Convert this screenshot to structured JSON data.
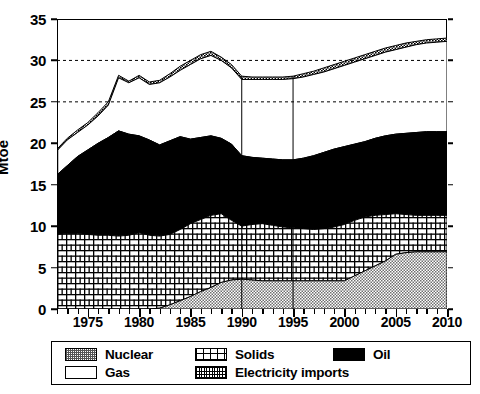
{
  "chart_data": {
    "type": "area",
    "stacked": true,
    "title": "",
    "xlabel": "",
    "ylabel": "Mtoe",
    "ylim": [
      0,
      35
    ],
    "xlim": [
      1972,
      2010
    ],
    "yticks": [
      0,
      5,
      10,
      15,
      20,
      25,
      30,
      35
    ],
    "xticks": [
      1975,
      1980,
      1985,
      1990,
      1995,
      2000,
      2005,
      2010
    ],
    "grid": "dashed horizontal gridlines at 25 and 30",
    "legend_position": "below-plot",
    "annotations": [
      {
        "type": "vertical-line",
        "x": 1990
      },
      {
        "type": "vertical-line",
        "x": 1995
      }
    ],
    "x": [
      1972,
      1973,
      1974,
      1975,
      1976,
      1977,
      1978,
      1979,
      1980,
      1981,
      1982,
      1983,
      1984,
      1985,
      1986,
      1987,
      1988,
      1989,
      1990,
      1991,
      1992,
      1993,
      1994,
      1995,
      1996,
      1997,
      1998,
      1999,
      2000,
      2001,
      2002,
      2003,
      2004,
      2005,
      2006,
      2007,
      2008,
      2009,
      2010
    ],
    "series": [
      {
        "name": "Nuclear",
        "pattern": "gray-stipple",
        "color": "#8c8c8c",
        "values": [
          0,
          0,
          0,
          0,
          0,
          0,
          0,
          0,
          0,
          0,
          0.1,
          0.5,
          1.0,
          1.5,
          2.1,
          2.6,
          3.2,
          3.5,
          3.6,
          3.5,
          3.4,
          3.4,
          3.4,
          3.4,
          3.4,
          3.4,
          3.4,
          3.4,
          3.4,
          4.0,
          4.6,
          5.2,
          5.8,
          6.6,
          6.8,
          6.9,
          6.9,
          6.9,
          6.9
        ]
      },
      {
        "name": "Solids",
        "pattern": "brick-grid",
        "color": "#ffffff",
        "values": [
          9.0,
          9.1,
          9.1,
          9.0,
          8.9,
          8.9,
          8.8,
          8.9,
          9.2,
          8.9,
          8.8,
          9.0,
          9.6,
          10.3,
          10.8,
          11.3,
          11.5,
          10.7,
          10.0,
          10.2,
          10.3,
          10.1,
          9.9,
          9.8,
          9.7,
          9.6,
          9.7,
          9.9,
          10.2,
          10.7,
          11.1,
          11.3,
          11.4,
          11.5,
          11.4,
          11.3,
          11.3,
          11.3,
          11.3
        ]
      },
      {
        "name": "Oil",
        "pattern": "solid-black",
        "color": "#000000",
        "values": [
          16.2,
          17.3,
          18.4,
          19.2,
          20.0,
          20.7,
          21.5,
          21.1,
          20.9,
          20.4,
          19.8,
          20.3,
          20.8,
          20.5,
          20.7,
          20.9,
          20.6,
          19.9,
          18.5,
          18.3,
          18.2,
          18.1,
          18.0,
          18.0,
          18.2,
          18.5,
          18.9,
          19.3,
          19.6,
          19.9,
          20.2,
          20.6,
          20.9,
          21.1,
          21.2,
          21.3,
          21.4,
          21.4,
          21.4
        ]
      },
      {
        "name": "Gas",
        "pattern": "white-empty",
        "color": "#ffffff",
        "values": [
          19.1,
          20.4,
          21.3,
          22.2,
          23.3,
          24.6,
          27.9,
          27.3,
          27.9,
          27.1,
          27.3,
          28.0,
          28.8,
          29.5,
          30.2,
          30.6,
          30.0,
          29.1,
          27.7,
          27.7,
          27.7,
          27.7,
          27.7,
          27.8,
          28.0,
          28.3,
          28.6,
          29.0,
          29.4,
          29.8,
          30.2,
          30.6,
          31.0,
          31.3,
          31.6,
          31.9,
          32.1,
          32.2,
          32.3
        ]
      },
      {
        "name": "Electricity imports",
        "pattern": "fine-checker",
        "color": "#222222",
        "values": [
          19.3,
          20.6,
          21.6,
          22.5,
          23.7,
          25.0,
          28.2,
          27.5,
          28.2,
          27.4,
          27.6,
          28.4,
          29.3,
          30.0,
          30.7,
          31.1,
          30.4,
          29.5,
          28.1,
          28.0,
          28.0,
          28.0,
          28.0,
          28.1,
          28.4,
          28.7,
          29.1,
          29.5,
          29.9,
          30.3,
          30.7,
          31.1,
          31.5,
          31.8,
          32.1,
          32.3,
          32.5,
          32.6,
          32.7
        ]
      }
    ]
  },
  "axis": {
    "y_title": "Mtoe",
    "y_tick_labels": [
      "0",
      "5",
      "10",
      "15",
      "20",
      "25",
      "30",
      "35"
    ],
    "x_tick_labels": [
      "1975",
      "1980",
      "1985",
      "1990",
      "1995",
      "2000",
      "2005",
      "2010"
    ]
  },
  "legend": {
    "items": [
      {
        "label": "Nuclear",
        "swatch": "nuclear"
      },
      {
        "label": "Solids",
        "swatch": "solids"
      },
      {
        "label": "Oil",
        "swatch": "oil"
      },
      {
        "label": "Gas",
        "swatch": "gas"
      },
      {
        "label": "Electricity imports",
        "swatch": "elec"
      }
    ]
  }
}
